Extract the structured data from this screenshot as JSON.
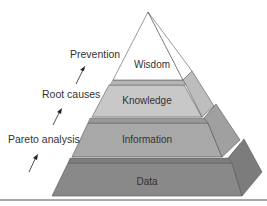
{
  "diagram": {
    "type": "pyramid",
    "levels": [
      {
        "label": "Wisdom",
        "color": "#ffffff",
        "side_color": "#ffffff"
      },
      {
        "label": "Knowledge",
        "color": "#c9c9c9",
        "side_color": "#b8b8b8"
      },
      {
        "label": "Information",
        "color": "#a9a9a9",
        "side_color": "#999999"
      },
      {
        "label": "Data",
        "color": "#8a8a8a",
        "side_color": "#7a7a7a"
      }
    ],
    "annotations": [
      {
        "label": "Prevention"
      },
      {
        "label": "Root causes"
      },
      {
        "label": "Pareto analysis"
      }
    ],
    "colors": {
      "stroke": "#444444",
      "text": "#333333",
      "ledge": "#9a9a9a",
      "baseline": "#555555"
    }
  }
}
